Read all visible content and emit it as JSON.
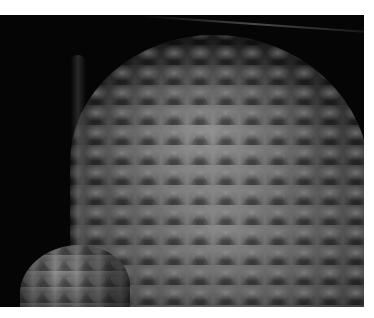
{
  "image": {
    "subject": "metallic scaled sculpture (pangolin-like form) against black background",
    "colors": {
      "background": "#050505",
      "border": "#ffffff",
      "scale_mid": "#8a8a8a",
      "scale_dark": "#3a3a3a"
    }
  }
}
